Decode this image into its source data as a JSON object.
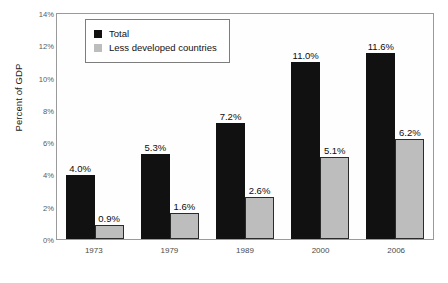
{
  "chart_data": {
    "type": "bar",
    "title": "",
    "subtitle": "",
    "xlabel": "",
    "ylabel": "Percent of GDP",
    "categories": [
      "1973",
      "1979",
      "1989",
      "2000",
      "2006"
    ],
    "series": [
      {
        "name": "Total",
        "color": "#111111",
        "values": [
          4.0,
          5.3,
          7.2,
          11.0,
          11.6
        ],
        "labels": [
          "4.0%",
          "5.3%",
          "7.2%",
          "11.0%",
          "11.6%"
        ]
      },
      {
        "name": "Less developed countries",
        "color": "#bdbdbd",
        "values": [
          0.9,
          1.6,
          2.6,
          5.1,
          6.2
        ],
        "labels": [
          "0.9%",
          "1.6%",
          "2.6%",
          "5.1%",
          "6.2%"
        ]
      }
    ],
    "ylim": [
      0,
      14
    ],
    "ytick_values": [
      0,
      2,
      4,
      6,
      8,
      10,
      12,
      14
    ],
    "ytick_labels": [
      "0%",
      "2%",
      "4%",
      "6%",
      "8%",
      "10%",
      "12%",
      "14%"
    ],
    "grid": false,
    "legend_position": "top-left-inside",
    "value_labels_shown": true
  },
  "legend": {
    "entries": [
      {
        "label": "Total",
        "swatch": "#111111"
      },
      {
        "label": "Less developed countries",
        "swatch": "#bdbdbd"
      }
    ]
  },
  "axes": {
    "y_title": "Percent of GDP"
  }
}
